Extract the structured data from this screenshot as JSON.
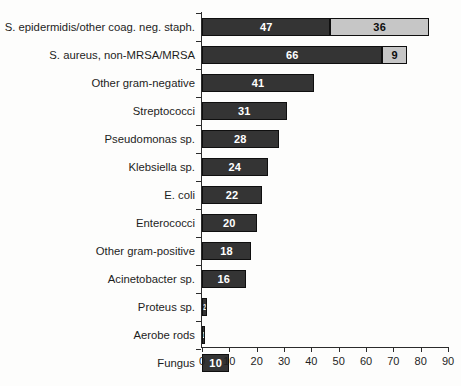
{
  "chart_data": {
    "type": "bar",
    "orientation": "horizontal",
    "stacked": true,
    "title": "",
    "subtitle": "",
    "xlabel": "",
    "ylabel": "",
    "xlim": [
      0,
      90
    ],
    "xticks": [
      0,
      10,
      20,
      30,
      40,
      50,
      60,
      70,
      80,
      90
    ],
    "grid": false,
    "legend": "none",
    "categories": [
      "S. epidermidis/other coag. neg. staph.",
      "S. aureus, non-MRSA/MRSA",
      "Other gram-negative",
      "Streptococci",
      "Pseudomonas sp.",
      "Klebsiella sp.",
      "E. coli",
      "Enterococci",
      "Other gram-positive",
      "Acinetobacter sp.",
      "Proteus sp.",
      "Aerobe rods",
      "Fungus"
    ],
    "series": [
      {
        "name": "primary",
        "color": "#343434",
        "values": [
          47,
          66,
          41,
          31,
          28,
          24,
          22,
          20,
          18,
          16,
          2,
          1,
          10
        ]
      },
      {
        "name": "secondary",
        "color": "#c6c6c6",
        "values": [
          36,
          9,
          0,
          0,
          0,
          0,
          0,
          0,
          0,
          0,
          0,
          0,
          0
        ]
      }
    ],
    "totals": [
      83,
      75,
      41,
      31,
      28,
      24,
      22,
      20,
      18,
      16,
      2,
      1,
      10
    ],
    "bar_labels": [
      [
        "47",
        "36"
      ],
      [
        "66",
        "9"
      ],
      [
        "41",
        ""
      ],
      [
        "31",
        ""
      ],
      [
        "28",
        ""
      ],
      [
        "24",
        ""
      ],
      [
        "22",
        ""
      ],
      [
        "20",
        ""
      ],
      [
        "18",
        ""
      ],
      [
        "16",
        ""
      ],
      [
        "2",
        ""
      ],
      [
        "1",
        ""
      ],
      [
        "10",
        ""
      ]
    ]
  },
  "colors": {
    "primary_bar": "#343434",
    "secondary_bar": "#c6c6c6",
    "axis": "#2b2b2b",
    "text": "#1d1d1d",
    "background": "#fdfdfc"
  }
}
